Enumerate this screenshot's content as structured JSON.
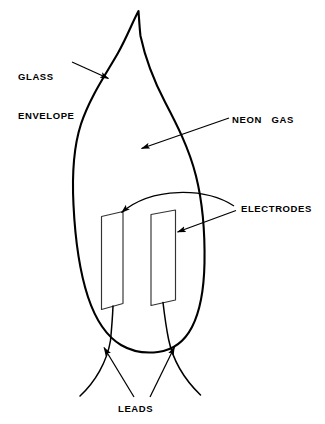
{
  "diagram": {
    "background_color": "#ffffff",
    "line_color": "#000000",
    "labels": {
      "glass_envelope": "GLASS\nENVELOPE",
      "glass_envelope_line1": "GLASS",
      "glass_envelope_line2": "ENVELOPE",
      "neon_gas": "NEON   GAS",
      "electrodes": "ELECTRODES",
      "leads": "LEADS"
    },
    "parts": [
      {
        "name": "glass-envelope",
        "label": "GLASS ENVELOPE"
      },
      {
        "name": "neon-gas",
        "label": "NEON   GAS"
      },
      {
        "name": "electrodes",
        "label": "ELECTRODES"
      },
      {
        "name": "leads",
        "label": "LEADS"
      }
    ]
  }
}
